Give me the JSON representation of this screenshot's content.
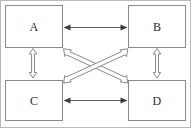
{
  "diagram": {
    "frame": {
      "border_color": "#b9b9b9"
    },
    "nodes": [
      {
        "id": "A",
        "label": "A",
        "position": "top-left"
      },
      {
        "id": "B",
        "label": "B",
        "position": "top-right"
      },
      {
        "id": "C",
        "label": "C",
        "position": "bottom-left"
      },
      {
        "id": "D",
        "label": "D",
        "position": "bottom-right"
      }
    ],
    "node_style": {
      "border_color": "#8a8a8a",
      "fill_color": "#ffffff",
      "label_color": "#2b2b2b"
    },
    "edges": [
      {
        "id": "ab",
        "from": "A",
        "to": "B",
        "direction": "bidirectional",
        "style": "thin-line",
        "orientation": "horizontal"
      },
      {
        "id": "cd",
        "from": "C",
        "to": "D",
        "direction": "bidirectional",
        "style": "thin-line",
        "orientation": "horizontal"
      },
      {
        "id": "ac",
        "from": "A",
        "to": "C",
        "direction": "bidirectional",
        "style": "double-line",
        "orientation": "vertical"
      },
      {
        "id": "bd",
        "from": "B",
        "to": "D",
        "direction": "bidirectional",
        "style": "double-line",
        "orientation": "vertical"
      },
      {
        "id": "ad",
        "from": "A",
        "to": "D",
        "direction": "bidirectional",
        "style": "double-line",
        "orientation": "diagonal"
      },
      {
        "id": "bc",
        "from": "B",
        "to": "C",
        "direction": "bidirectional",
        "style": "double-line",
        "orientation": "diagonal"
      }
    ],
    "edge_style": {
      "thin_stroke_color": "#5e5e5e",
      "open_stroke_color": "#7d7d7d",
      "open_fill_color": "#ffffff"
    }
  }
}
